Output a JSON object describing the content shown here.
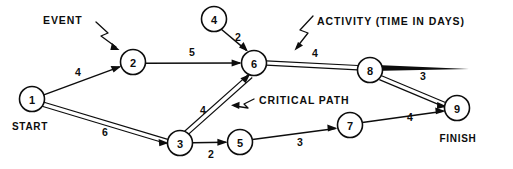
{
  "diagram": {
    "type": "network-activity-on-arrow",
    "colors": {
      "ink": "#0d0d0d",
      "background": "#ffffff"
    },
    "nodes": [
      {
        "id": "1",
        "label": "1",
        "x": 32,
        "y": 99,
        "r": 12.5
      },
      {
        "id": "2",
        "label": "2",
        "x": 133,
        "y": 62,
        "r": 12.5
      },
      {
        "id": "3",
        "label": "3",
        "x": 180,
        "y": 143,
        "r": 12.5
      },
      {
        "id": "4",
        "label": "4",
        "x": 214,
        "y": 19,
        "r": 12.5
      },
      {
        "id": "5",
        "label": "5",
        "x": 240,
        "y": 142,
        "r": 12.5
      },
      {
        "id": "6",
        "label": "6",
        "x": 254,
        "y": 63,
        "r": 12.5
      },
      {
        "id": "7",
        "label": "7",
        "x": 350,
        "y": 125,
        "r": 12.5
      },
      {
        "id": "8",
        "label": "8",
        "x": 370,
        "y": 70,
        "r": 12.5
      },
      {
        "id": "9",
        "label": "9",
        "x": 457,
        "y": 108,
        "r": 12.5
      }
    ],
    "edges": [
      {
        "from": "1",
        "to": "2",
        "weight": "4",
        "critical": false,
        "label_x": 78,
        "label_y": 72
      },
      {
        "from": "1",
        "to": "3",
        "weight": "6",
        "critical": true,
        "label_x": 105,
        "label_y": 132
      },
      {
        "from": "2",
        "to": "6",
        "weight": "5",
        "critical": false,
        "label_x": 192,
        "label_y": 52
      },
      {
        "from": "4",
        "to": "6",
        "weight": "2",
        "critical": false,
        "label_x": 238,
        "label_y": 37
      },
      {
        "from": "3",
        "to": "6",
        "weight": "4",
        "critical": true,
        "label_x": 203,
        "label_y": 110
      },
      {
        "from": "3",
        "to": "5",
        "weight": "2",
        "critical": false,
        "label_x": 211,
        "label_y": 154
      },
      {
        "from": "5",
        "to": "7",
        "weight": "3",
        "critical": false,
        "label_x": 300,
        "label_y": 142
      },
      {
        "from": "7",
        "to": "9",
        "weight": "4",
        "critical": false,
        "label_x": 410,
        "label_y": 117
      },
      {
        "from": "6",
        "to": "8",
        "weight": "4",
        "critical": true,
        "label_x": 315,
        "label_y": 53
      },
      {
        "from": "8",
        "to": "9",
        "weight": "3",
        "critical": true,
        "label_x": 423,
        "label_y": 76
      }
    ],
    "terminals": [
      {
        "name": "start",
        "text": "START",
        "x": 30,
        "y": 126
      },
      {
        "name": "finish",
        "text": "FINISH",
        "x": 458,
        "y": 138
      }
    ],
    "callouts": [
      {
        "name": "event",
        "text": "EVENT",
        "x": 68,
        "y": 20
      },
      {
        "name": "activity",
        "text": "ACTIVITY (TIME IN DAYS)",
        "x": 355,
        "y": 21
      },
      {
        "name": "critical",
        "text": "CRITICAL PATH",
        "x": 259,
        "y": 100
      }
    ]
  }
}
